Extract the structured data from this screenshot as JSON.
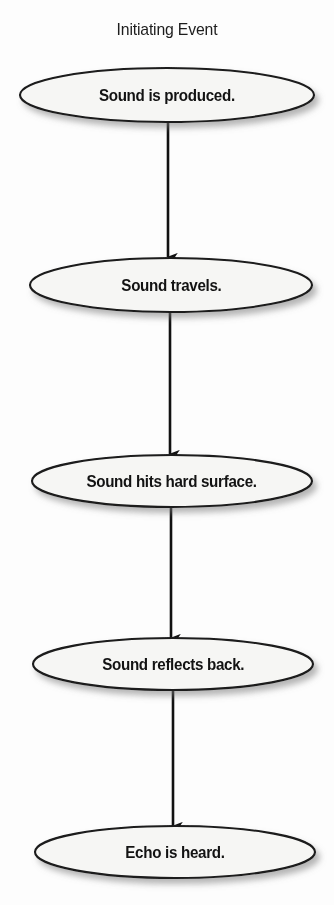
{
  "diagram": {
    "type": "flowchart",
    "orientation": "vertical",
    "title": "Initiating Event",
    "background_color": "#fdfdfd",
    "node_shape": "ellipse",
    "node_fill_color": "#f6f6f4",
    "node_stroke_color": "#1a1a1a",
    "connector_color": "#111111",
    "text_color": "#131313",
    "nodes": [
      {
        "id": "node-1",
        "label": "Sound is produced.",
        "cx": 167,
        "cy": 95,
        "rx": 147,
        "ry": 27
      },
      {
        "id": "node-2",
        "label": "Sound travels.",
        "cx": 171,
        "cy": 285,
        "rx": 141,
        "ry": 27
      },
      {
        "id": "node-3",
        "label": "Sound hits hard surface.",
        "cx": 172,
        "cy": 481,
        "rx": 140,
        "ry": 26
      },
      {
        "id": "node-4",
        "label": "Sound reflects back.",
        "cx": 173,
        "cy": 664,
        "rx": 140,
        "ry": 26
      },
      {
        "id": "node-5",
        "label": "Echo is heard.",
        "cx": 175,
        "cy": 852,
        "rx": 140,
        "ry": 26
      }
    ],
    "connectors": [
      {
        "id": "arrow-1",
        "from": "node-1",
        "to": "node-2",
        "x": 168,
        "y1": 122,
        "y2": 258,
        "arrowhead": "down"
      },
      {
        "id": "arrow-2",
        "from": "node-2",
        "to": "node-3",
        "x": 170,
        "y1": 312,
        "y2": 455,
        "arrowhead": "down"
      },
      {
        "id": "arrow-3",
        "from": "node-3",
        "to": "node-4",
        "x": 171,
        "y1": 507,
        "y2": 639,
        "arrowhead": "down"
      },
      {
        "id": "arrow-4",
        "from": "node-4",
        "to": "node-5",
        "x": 173,
        "y1": 690,
        "y2": 827,
        "arrowhead": "down"
      }
    ]
  }
}
